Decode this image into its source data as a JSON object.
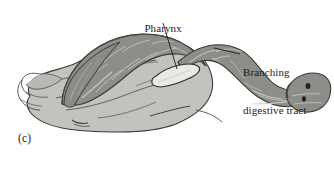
{
  "figure": {
    "panel_label": "(c)",
    "caption_alt": "Grayscale anatomical illustration of a flatworm showing the pharynx and the branching digestive tract",
    "background_color": "#ffffff"
  },
  "labels": [
    {
      "id": "pharynx",
      "text": "Pharynx",
      "lines": [
        "Pharynx"
      ],
      "leader_from": [
        163,
        23
      ],
      "leader_to": [
        177,
        69
      ]
    },
    {
      "id": "branching-digestive-tract",
      "text": "Branching digestive tract",
      "lines": [
        "Branching",
        "digestive tract"
      ],
      "leader_from": [
        240,
        54
      ],
      "leader_to": [
        214,
        48
      ]
    }
  ],
  "anatomy": {
    "body": {
      "name": "flatworm-body",
      "fill": "#c3c2be",
      "outline": "#3a3a38"
    },
    "digestive_tract": {
      "name": "branching-digestive-tract",
      "fill": "#8d8d89",
      "branch_line": "#c9c9c4",
      "outline": "#3a3a38"
    },
    "pharynx": {
      "name": "pharynx",
      "fill": "#e8e8e4",
      "outline": "#2e2e2c"
    },
    "eyespots": {
      "name": "eyespots",
      "count": 2,
      "fill": "#232322"
    }
  },
  "colors": {
    "ink": "#1b1b1b",
    "leader_line": "#1b1b1b",
    "body_light_gray": "#c3c2be",
    "tract_dark_gray": "#8d8d89",
    "tract_vein_light": "#c9c9c4",
    "outline_dark": "#3a3a38",
    "pharynx_white": "#e8e8e4",
    "eyespot_black": "#232322"
  }
}
